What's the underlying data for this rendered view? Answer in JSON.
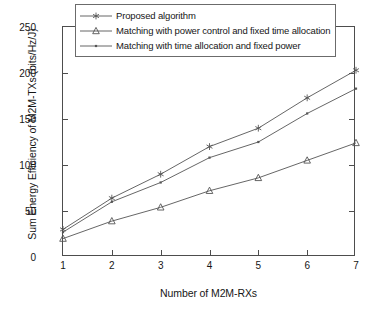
{
  "chart_data": {
    "type": "line",
    "title": "",
    "xlabel": "Number of M2M-RXs",
    "ylabel": "Sum Energy Efficiency of M2M-TXs (bits/Hz/J)",
    "x": [
      1,
      2,
      3,
      4,
      5,
      6,
      7
    ],
    "xlim": [
      1,
      7
    ],
    "ylim": [
      0,
      250
    ],
    "xticks": [
      "1",
      "2",
      "3",
      "4",
      "5",
      "6",
      "7"
    ],
    "yticks": [
      "0",
      "50",
      "100",
      "150",
      "200",
      "250"
    ],
    "grid": false,
    "legend_position": "upper center",
    "series": [
      {
        "name": "Proposed algorithm",
        "marker": "asterisk",
        "color": "#555555",
        "values": [
          30,
          64,
          90,
          120,
          140,
          173,
          203
        ]
      },
      {
        "name": "Matching with power control and fixed time allocation",
        "marker": "triangle",
        "color": "#555555",
        "values": [
          20,
          39,
          54,
          72,
          86,
          105,
          124
        ]
      },
      {
        "name": "Matching with time allocation and fixed power",
        "marker": "dot",
        "color": "#555555",
        "values": [
          27,
          60,
          81,
          108,
          125,
          156,
          183
        ]
      }
    ]
  }
}
